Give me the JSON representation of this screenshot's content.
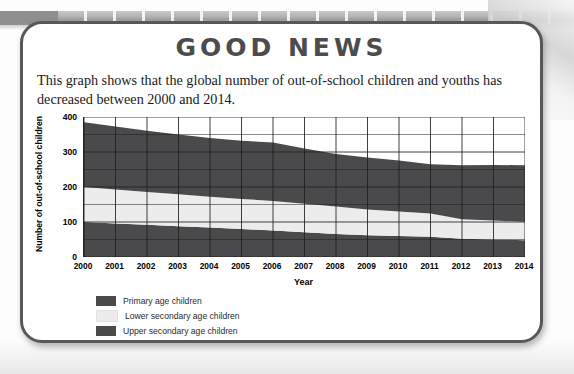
{
  "card": {
    "headline": "GOOD NEWS",
    "intro": "This graph shows that the global number of out-of-school children and youths has decreased between 2000 and 2014."
  },
  "colors": {
    "primary_band": "#4a4a4c",
    "lower_secondary_band": "#ececec",
    "upper_secondary_band": "#4a4a4c",
    "headline": "#4c4c4e",
    "card_border": "#58585a",
    "grid": "#1e1e1e"
  },
  "legend": {
    "items": [
      {
        "label": "Primary age children",
        "color": "#4a4a4c"
      },
      {
        "label": "Lower secondary age children",
        "color": "#ececec"
      },
      {
        "label": "Upper secondary age children",
        "color": "#4a4a4c"
      }
    ]
  },
  "chart_data": {
    "type": "area",
    "stacked": true,
    "title": "",
    "xlabel": "Year",
    "ylabel": "Number of out-of-school children",
    "ylim": [
      0,
      400
    ],
    "yticks": [
      0,
      100,
      200,
      300,
      400
    ],
    "grid": true,
    "legend_position": "below-left",
    "categories": [
      "2000",
      "2001",
      "2002",
      "2003",
      "2004",
      "2005",
      "2006",
      "2007",
      "2008",
      "2009",
      "2010",
      "2011",
      "2012",
      "2013",
      "2014"
    ],
    "x": [
      2000,
      2001,
      2002,
      2003,
      2004,
      2005,
      2006,
      2007,
      2008,
      2009,
      2010,
      2011,
      2012,
      2013,
      2014
    ],
    "series": [
      {
        "name": "Primary age children",
        "color": "#4a4a4c",
        "values": [
          100,
          96,
          92,
          88,
          84,
          80,
          76,
          71,
          66,
          62,
          60,
          58,
          52,
          50,
          48
        ]
      },
      {
        "name": "Lower secondary age children",
        "color": "#ececec",
        "values": [
          100,
          97,
          94,
          91,
          88,
          86,
          84,
          81,
          78,
          74,
          70,
          66,
          56,
          54,
          53
        ]
      },
      {
        "name": "Upper secondary age children",
        "color": "#4a4a4c",
        "values": [
          185,
          180,
          175,
          171,
          168,
          166,
          167,
          158,
          150,
          148,
          146,
          141,
          154,
          159,
          161
        ]
      }
    ],
    "cumulative_totals": [
      385,
      373,
      361,
      350,
      340,
      332,
      327,
      310,
      294,
      284,
      276,
      265,
      262,
      263,
      262
    ]
  }
}
